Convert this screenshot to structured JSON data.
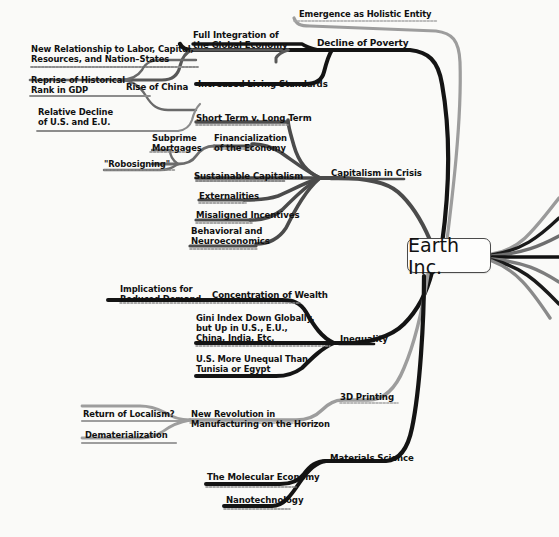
{
  "diagram": {
    "type": "mind-map",
    "title": "Earth Inc.",
    "background_color": "#fafaf8",
    "colors": {
      "black_branch": "#141414",
      "gray_branch": "#8d8d8d",
      "dark_gray_branch": "#555555",
      "text": "#111111",
      "node_border": "#4a4a4a",
      "node_fill": "#fdfdfc"
    },
    "center_label": "Earth Inc."
  },
  "branches": [
    {
      "id": "emergence",
      "label": "Emergence as Holistic Entity",
      "color": "gray",
      "children": []
    },
    {
      "id": "decline-of-poverty",
      "label": "Decline of Poverty",
      "color": "black",
      "children": [
        {
          "id": "increased-living-standards",
          "label": "Increased Living Standards",
          "children": []
        },
        {
          "id": "full-integration",
          "label": "Full Integration of\nthe Global Economy",
          "children": [
            {
              "id": "rise-of-china",
              "label": "Rise of China",
              "children": [
                {
                  "id": "new-relationship",
                  "label": "New Relationship to Labor, Capital,\nResources, and Nation–States"
                },
                {
                  "id": "reprise-historical-rank",
                  "label": "Reprise of Historical\nRank in GDP"
                },
                {
                  "id": "relative-decline",
                  "label": "Relative Decline\nof U.S. and E.U."
                }
              ]
            }
          ]
        }
      ]
    },
    {
      "id": "capitalism-in-crisis",
      "label": "Capitalism in Crisis",
      "color": "dark-gray",
      "children": [
        {
          "id": "short-term-long-term",
          "label": "Short Term v. Long Term"
        },
        {
          "id": "financialization",
          "label": "Financialization\nof the Economy",
          "children": [
            {
              "id": "subprime-mortgages",
              "label": "Subprime\nMortgages",
              "children": [
                {
                  "id": "robosigning",
                  "label": "\"Robosigning\""
                }
              ]
            }
          ]
        },
        {
          "id": "sustainable-capitalism",
          "label": "Sustainable Capitalism"
        },
        {
          "id": "externalities",
          "label": "Externalities"
        },
        {
          "id": "misaligned-incentives",
          "label": "Misaligned Incentives"
        },
        {
          "id": "behavioral-neuroeconomics",
          "label": "Behavioral and\nNeuroeconomics"
        }
      ]
    },
    {
      "id": "inequality",
      "label": "Inequality",
      "color": "black",
      "children": [
        {
          "id": "concentration-of-wealth",
          "label": "Concentration of Wealth",
          "children": [
            {
              "id": "implications-reduced-demand",
              "label": "Implications for\nReduced Demand"
            }
          ]
        },
        {
          "id": "gini-index",
          "label": "Gini Index Down Globally,\nbut Up in U.S., E.U.,\nChina, India, Etc."
        },
        {
          "id": "us-more-unequal",
          "label": "U.S. More Unequal Than\nTunisia or Egypt"
        }
      ]
    },
    {
      "id": "3d-printing",
      "label": "3D Printing",
      "color": "gray",
      "children": [
        {
          "id": "new-revolution",
          "label": "New Revolution in\nManufacturing on the Horizon",
          "children": [
            {
              "id": "return-of-localism",
              "label": "Return of Localism?"
            },
            {
              "id": "dematerialization",
              "label": "Dematerialization"
            }
          ]
        }
      ]
    },
    {
      "id": "materials-science",
      "label": "Materials Science",
      "color": "black",
      "children": [
        {
          "id": "molecular-economy",
          "label": "The Molecular Economy"
        },
        {
          "id": "nanotechnology",
          "label": "Nanotechnology"
        }
      ]
    }
  ],
  "labels": [
    {
      "key": "emergence",
      "text": "Emergence as Holistic Entity",
      "x": 299,
      "y": 10,
      "size": 8.4,
      "align": "left"
    },
    {
      "key": "decline_of_poverty",
      "text": "Decline of Poverty",
      "x": 317,
      "y": 38,
      "size": 9.0,
      "align": "left"
    },
    {
      "key": "full_integration",
      "text": "Full Integration of\nthe Global Economy",
      "x": 193,
      "y": 30,
      "size": 8.6,
      "align": "left"
    },
    {
      "key": "new_relationship",
      "text": "New Relationship to Labor, Capital,\nResources, and Nation–States",
      "x": 31,
      "y": 45,
      "size": 8.4,
      "align": "left"
    },
    {
      "key": "increased_living_standards",
      "text": "Increased Living Standards",
      "x": 198,
      "y": 79,
      "size": 8.6,
      "align": "left"
    },
    {
      "key": "rise_of_china",
      "text": "Rise of China",
      "x": 126,
      "y": 82,
      "size": 8.6,
      "align": "left"
    },
    {
      "key": "reprise_historical",
      "text": "Reprise of Historical\nRank in GDP",
      "x": 31,
      "y": 76,
      "size": 8.4,
      "align": "left"
    },
    {
      "key": "relative_decline",
      "text": "Relative Decline\nof U.S. and E.U.",
      "x": 38,
      "y": 108,
      "size": 8.4,
      "align": "left"
    },
    {
      "key": "short_term_long_term",
      "text": "Short Term v. Long Term",
      "x": 196,
      "y": 113,
      "size": 8.6,
      "align": "left"
    },
    {
      "key": "subprime_mortgages",
      "text": "Subprime\nMortgages",
      "x": 152,
      "y": 134,
      "size": 8.4,
      "align": "left"
    },
    {
      "key": "financialization",
      "text": "Financialization\nof the Economy",
      "x": 214,
      "y": 134,
      "size": 8.4,
      "align": "left"
    },
    {
      "key": "robosigning",
      "text": "\"Robosigning\"",
      "x": 104,
      "y": 160,
      "size": 8.4,
      "align": "left"
    },
    {
      "key": "capitalism_in_crisis",
      "text": "Capitalism in Crisis",
      "x": 331,
      "y": 168,
      "size": 8.6,
      "align": "left"
    },
    {
      "key": "sustainable_capitalism",
      "text": "Sustainable Capitalism",
      "x": 194,
      "y": 171,
      "size": 8.6,
      "align": "left"
    },
    {
      "key": "externalities",
      "text": "Externalities",
      "x": 199,
      "y": 191,
      "size": 8.6,
      "align": "left"
    },
    {
      "key": "misaligned_incentives",
      "text": "Misaligned Incentives",
      "x": 196,
      "y": 210,
      "size": 8.6,
      "align": "left"
    },
    {
      "key": "behavioral_neuro",
      "text": "Behavioral and\nNeuroeconomics",
      "x": 191,
      "y": 226,
      "size": 8.6,
      "align": "left"
    },
    {
      "key": "implications_reduced",
      "text": "Implications for\nReduced Demand",
      "x": 120,
      "y": 285,
      "size": 8.4,
      "align": "left"
    },
    {
      "key": "concentration_of_wealth",
      "text": "Concentration of Wealth",
      "x": 212,
      "y": 290,
      "size": 8.6,
      "align": "left"
    },
    {
      "key": "gini_index",
      "text": "Gini Index Down Globally,\nbut Up in U.S., E.U.,\nChina, India, Etc.",
      "x": 196,
      "y": 314,
      "size": 8.4,
      "align": "left"
    },
    {
      "key": "inequality",
      "text": "Inequality",
      "x": 340,
      "y": 334,
      "size": 8.6,
      "align": "left"
    },
    {
      "key": "us_more_unequal",
      "text": "U.S. More Unequal Than\nTunisia or Egypt",
      "x": 196,
      "y": 355,
      "size": 8.4,
      "align": "left"
    },
    {
      "key": "three_d_printing",
      "text": "3D Printing",
      "x": 340,
      "y": 392,
      "size": 8.6,
      "align": "left"
    },
    {
      "key": "return_of_localism",
      "text": "Return of Localism?",
      "x": 83,
      "y": 410,
      "size": 8.4,
      "align": "left"
    },
    {
      "key": "new_revolution",
      "text": "New Revolution in\nManufacturing on the Horizon",
      "x": 191,
      "y": 410,
      "size": 8.4,
      "align": "left"
    },
    {
      "key": "dematerialization",
      "text": "Dematerialization",
      "x": 85,
      "y": 431,
      "size": 8.4,
      "align": "left"
    },
    {
      "key": "materials_science",
      "text": "Materials Science",
      "x": 330,
      "y": 453,
      "size": 8.6,
      "align": "left"
    },
    {
      "key": "molecular_economy",
      "text": "The Molecular Economy",
      "x": 207,
      "y": 472,
      "size": 8.6,
      "align": "left"
    },
    {
      "key": "nanotechnology",
      "text": "Nanotechnology",
      "x": 226,
      "y": 495,
      "size": 8.6,
      "align": "left"
    }
  ]
}
